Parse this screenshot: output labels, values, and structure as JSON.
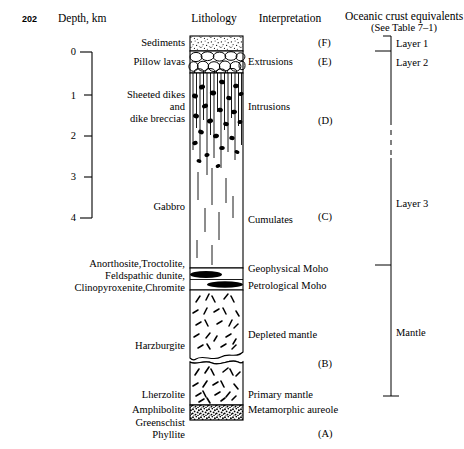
{
  "page": {
    "number": "202"
  },
  "headers": {
    "depth": "Depth, km",
    "lithology": "Lithology",
    "interpretation": "Interpretation",
    "oceanic": "Oceanic crust equivalents",
    "oceanic_sub": "(See Table 7–1)"
  },
  "depth_axis": {
    "unit": "km",
    "ticks": [
      "0",
      "1",
      "2",
      "3",
      "4"
    ],
    "values": [
      0,
      1,
      2,
      3,
      4
    ],
    "range": [
      0,
      4
    ]
  },
  "lithology_labels": [
    {
      "text": "Sediments"
    },
    {
      "text": "Pillow lavas"
    },
    {
      "text": "Sheeted dikes"
    },
    {
      "text": "and"
    },
    {
      "text": "dike breccias"
    },
    {
      "text": "Gabbro"
    },
    {
      "text": "Anorthosite,Troctolite,"
    },
    {
      "text": "Feldspathic dunite,"
    },
    {
      "text": "Clinopyroxenite,Chromite"
    },
    {
      "text": "Harzburgite"
    },
    {
      "text": "Lherzolite"
    },
    {
      "text": "Amphibolite"
    },
    {
      "text": "Greenschist"
    },
    {
      "text": "Phyllite"
    }
  ],
  "interpretation_labels": [
    {
      "text": "Extrusions"
    },
    {
      "text": "Intrusions"
    },
    {
      "text": "Cumulates"
    },
    {
      "text": "Geophysical Moho"
    },
    {
      "text": "Petrological Moho"
    },
    {
      "text": "Depleted mantle"
    },
    {
      "text": "Primary mantle"
    },
    {
      "text": "Metamorphic aureole"
    }
  ],
  "markers": [
    {
      "text": "(F)"
    },
    {
      "text": "(E)"
    },
    {
      "text": "(D)"
    },
    {
      "text": "(C)"
    },
    {
      "text": "(B)"
    },
    {
      "text": "(A)"
    }
  ],
  "oceanic_layers": [
    {
      "text": "Layer 1"
    },
    {
      "text": "Layer 2"
    },
    {
      "text": "Layer 3"
    },
    {
      "text": "Mantle"
    }
  ],
  "colors": {
    "ink": "#000000",
    "paper": "#ffffff",
    "rule": "#000000"
  }
}
